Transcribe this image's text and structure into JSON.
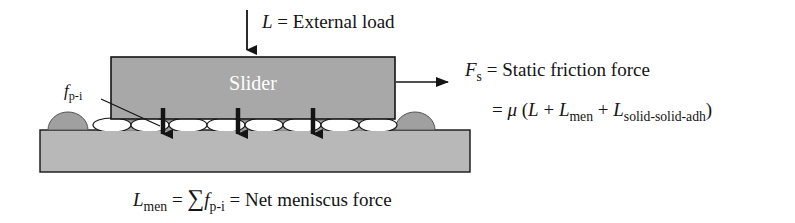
{
  "figure": {
    "background_color": "#ffffff",
    "line_color": "#141414",
    "slider_fill": "#a8a8a8",
    "substrate_fill": "#b8b8b8",
    "asperity_fill": "#a0a0a0",
    "meniscus_fill": "#ffffff",
    "slider_text_color": "#ffffff"
  },
  "labels": {
    "slider": "Slider",
    "load": {
      "symbol": "L",
      "equals": " = ",
      "text": "External load",
      "full": "L = External load"
    },
    "friction": {
      "symbol": "F",
      "subscript": "s",
      "equals": " = ",
      "text": "Static friction force",
      "full": "Fs = Static friction force"
    },
    "friction_equation": {
      "equals": "= ",
      "mu": "μ",
      "open": " (",
      "term1": "L",
      "plus1": " + ",
      "term2": "L",
      "term2_sub": "men",
      "plus2": " + ",
      "term3": "L",
      "term3_sub": "solid-solid-adh",
      "close": ")",
      "full": "= μ (L + Lmen + Lsolid-solid-adh)"
    },
    "meniscus_force_callout": {
      "symbol": "f",
      "subscript": "p-i",
      "full": "fp-i"
    },
    "net_meniscus": {
      "symbol": "L",
      "subscript": "men",
      "equals1": " = ",
      "sigma": "∑",
      "term_symbol": "f",
      "term_sub": "p-i",
      "equals2": " = ",
      "text": "Net meniscus force",
      "full": "Lmen = ∑ fp-i = Net meniscus force"
    }
  },
  "arrows": {
    "load_arrow": "downward-arrow-external-load",
    "friction_arrow": "rightward-arrow-static-friction",
    "meniscus_arrows": [
      "downward-arrow-meniscus-1",
      "downward-arrow-meniscus-2",
      "downward-arrow-meniscus-3"
    ],
    "callout_leader": "leader-line-fpi"
  },
  "geometry": {
    "slider": {
      "x": 111,
      "y": 57,
      "width": 284,
      "height": 62
    },
    "substrate": {
      "x": 40,
      "y": 130,
      "width": 430,
      "height": 42
    },
    "interface": {
      "y_top": 119,
      "y_bottom": 130
    },
    "asperity_count": 8,
    "meniscus_count": 7
  }
}
